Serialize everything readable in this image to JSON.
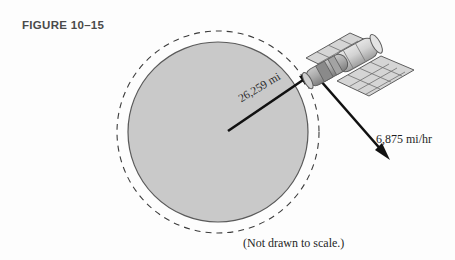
{
  "figure": {
    "title": "FIGURE 10–15",
    "caption": "(Not drawn to scale.)"
  },
  "labels": {
    "radius": "26,259 mi",
    "velocity": "6,875 mi/hr"
  },
  "colors": {
    "planet_fill": "#c9c9c9",
    "planet_stroke": "#5a5a5a",
    "orbit_dash": "#3c3c3c",
    "arrow": "#111111",
    "satellite_body_light": "#dcdcdc",
    "satellite_body_mid": "#b4b4b4",
    "satellite_body_dark": "#8a8a8a",
    "panel_fill": "#d5d5d5",
    "panel_grid": "#6e6e6e",
    "title_text": "#4a4a4a",
    "background": "#fdfdfd"
  },
  "geometry": {
    "planet_center": [
      218,
      132
    ],
    "planet_radius": 90,
    "orbit_radius": 101,
    "satellite_point": [
      313,
      72
    ],
    "velocity_arrow_tip": [
      389,
      159
    ]
  },
  "icons": {
    "planet": "planet-circle",
    "orbit": "orbit-dashed-circle",
    "satellite": "satellite-icon",
    "radius_arrow": "radius-arrow-icon",
    "velocity_arrow": "velocity-arrow-icon"
  }
}
